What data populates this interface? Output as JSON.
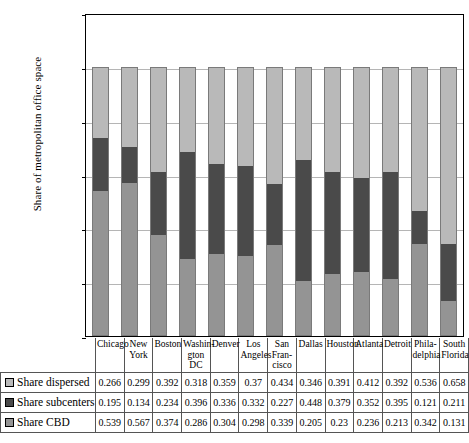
{
  "chart_data": {
    "type": "bar",
    "stacked": true,
    "title": "",
    "xlabel": "",
    "ylabel": "Share of metropolitan office space",
    "ylim": [
      0,
      1.2
    ],
    "yticks": [
      0,
      0.2,
      0.4,
      0.6,
      0.8,
      1,
      1.2
    ],
    "ytick_labels": [
      "0",
      "0.2",
      "0.4",
      "0.6",
      "0.8",
      "1",
      "1.2"
    ],
    "grid": true,
    "legend_position": "table-first-column",
    "categories": [
      "Chicago",
      "New York",
      "Boston",
      "Washington DC",
      "Denver",
      "Los Angeles",
      "San Francisco",
      "Dallas",
      "Houston",
      "Atlanta",
      "Detroit",
      "Philadelphia",
      "South Florida"
    ],
    "category_lines": [
      [
        "Chicago"
      ],
      [
        "New",
        "York"
      ],
      [
        "Boston"
      ],
      [
        "Washin-",
        "gton DC"
      ],
      [
        "Denver"
      ],
      [
        "Los",
        "Angeles"
      ],
      [
        "San",
        "Fran-",
        "cisco"
      ],
      [
        "Dallas"
      ],
      [
        "Houston"
      ],
      [
        "Atlanta"
      ],
      [
        "Detroit"
      ],
      [
        "Phila-",
        "delphia"
      ],
      [
        "South",
        "Florida"
      ]
    ],
    "series": [
      {
        "name": "Share dispersed",
        "color": "#b9b9b9",
        "stack_order": 3,
        "values": [
          0.266,
          0.299,
          0.392,
          0.318,
          0.359,
          0.37,
          0.434,
          0.346,
          0.391,
          0.412,
          0.392,
          0.536,
          0.658
        ]
      },
      {
        "name": "Share subcenters",
        "color": "#4a4a4a",
        "stack_order": 2,
        "values": [
          0.195,
          0.134,
          0.234,
          0.396,
          0.336,
          0.332,
          0.227,
          0.448,
          0.379,
          0.352,
          0.395,
          0.121,
          0.211
        ]
      },
      {
        "name": "Share CBD",
        "color": "#949494",
        "stack_order": 1,
        "values": [
          0.539,
          0.567,
          0.374,
          0.286,
          0.304,
          0.298,
          0.339,
          0.205,
          0.23,
          0.236,
          0.213,
          0.342,
          0.131
        ]
      }
    ]
  },
  "table": {
    "row_labels": [
      "Share dispersed",
      "Share subcenters",
      "Share CBD"
    ],
    "rows": [
      [
        "0.266",
        "0.299",
        "0.392",
        "0.318",
        "0.359",
        "0.37",
        "0.434",
        "0.346",
        "0.391",
        "0.412",
        "0.392",
        "0.536",
        "0.658"
      ],
      [
        "0.195",
        "0.134",
        "0.234",
        "0.396",
        "0.336",
        "0.332",
        "0.227",
        "0.448",
        "0.379",
        "0.352",
        "0.395",
        "0.121",
        "0.211"
      ],
      [
        "0.539",
        "0.567",
        "0.374",
        "0.286",
        "0.304",
        "0.298",
        "0.339",
        "0.205",
        "0.23",
        "0.236",
        "0.213",
        "0.342",
        "0.131"
      ]
    ]
  }
}
